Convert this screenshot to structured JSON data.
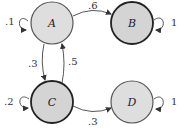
{
  "diagram": {
    "type": "markov-chain-state-diagram",
    "nodes": [
      {
        "id": "A",
        "label": "A",
        "cx": 52,
        "cy": 23,
        "r": 22,
        "fill": "#dedede",
        "stroke": "#555555",
        "stroke_width": 1.2
      },
      {
        "id": "B",
        "label": "B",
        "cx": 132,
        "cy": 23,
        "r": 21,
        "fill": "#d4d4d4",
        "stroke": "#222222",
        "stroke_width": 1.8
      },
      {
        "id": "C",
        "label": "C",
        "cx": 52,
        "cy": 102,
        "r": 21,
        "fill": "#d4d4d4",
        "stroke": "#222222",
        "stroke_width": 1.8
      },
      {
        "id": "D",
        "label": "D",
        "cx": 132,
        "cy": 102,
        "r": 21,
        "fill": "#dedede",
        "stroke": "#555555",
        "stroke_width": 1.2
      }
    ],
    "edges": [
      {
        "from": "A",
        "to": "A",
        "label": ".1"
      },
      {
        "from": "A",
        "to": "B",
        "label": ".6"
      },
      {
        "from": "A",
        "to": "C",
        "label": ".3"
      },
      {
        "from": "B",
        "to": "B",
        "label": "1"
      },
      {
        "from": "C",
        "to": "A",
        "label": ".5"
      },
      {
        "from": "C",
        "to": "C",
        "label": ".2"
      },
      {
        "from": "C",
        "to": "D",
        "label": ".3"
      },
      {
        "from": "D",
        "to": "D",
        "label": "1"
      }
    ]
  }
}
